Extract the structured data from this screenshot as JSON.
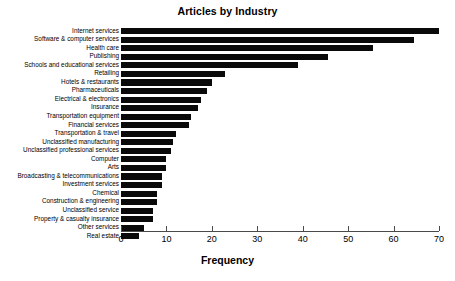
{
  "chart_data": {
    "type": "bar",
    "orientation": "horizontal",
    "title": "Articles by Industry",
    "xlabel": "Frequency",
    "ylabel": "",
    "xlim": [
      0,
      70
    ],
    "xticks": [
      0,
      10,
      20,
      30,
      40,
      50,
      60,
      70
    ],
    "grid": false,
    "legend": null,
    "bar_color": "#0a0a0a",
    "categories": [
      "Internet services",
      "Software & computer services",
      "Health care",
      "Publishing",
      "Schools and educational services",
      "Retailing",
      "Hotels & restaurants",
      "Pharmaceuticals",
      "Electrical & electronics",
      "Insurance",
      "Transportation equipment",
      "Financial services",
      "Transportation & travel",
      "Unclassified manufacturing",
      "Unclassified professional services",
      "Computer",
      "Arts",
      "Broadcasting & telecommunications",
      "Investment services",
      "Chemical",
      "Construction & engineering",
      "Unclassified service",
      "Property & casualty insurance",
      "Other services",
      "Real estate"
    ],
    "values": [
      70,
      64.5,
      55.5,
      45.5,
      39,
      23,
      20,
      19,
      17.5,
      17,
      15.5,
      15,
      12,
      11.5,
      11,
      10,
      10,
      9,
      9,
      8,
      8,
      7,
      7,
      5,
      4
    ]
  }
}
